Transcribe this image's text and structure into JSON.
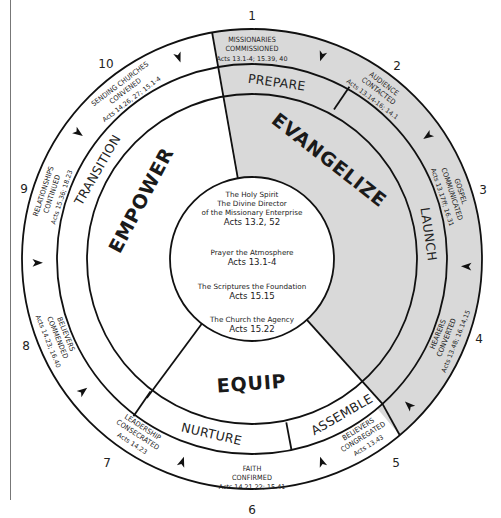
{
  "colors": {
    "shaded": "#d9d9d9",
    "white": "#ffffff",
    "line": "#111111",
    "text": "#222222"
  },
  "center": {
    "lines": [
      "The Holy Spirit",
      "The Divine Director",
      "of the Missionary Enterprise",
      "Acts 13.2, 52",
      "Prayer the Atmosphere",
      "Acts 13.1-4",
      "The Scriptures the Foundation",
      "Acts 15.15",
      "The Church the Agency",
      "Acts 15.22"
    ]
  },
  "phases": {
    "evangelize": "EVANGELIZE",
    "empower": "EMPOWER",
    "equip": "EQUIP"
  },
  "stages": {
    "prepare": "PREPARE",
    "launch": "LAUNCH",
    "assemble": "ASSEMBLE",
    "nurture": "NURTURE",
    "transition": "TRANSITION"
  },
  "steps": [
    {
      "number": "1",
      "line1": "MISSIONARIES",
      "line2": "COMMISSIONED",
      "ref": "Acts 13.1-4; 15.39, 40"
    },
    {
      "number": "2",
      "line1": "AUDIENCE",
      "line2": "CONTACTED",
      "ref": "Acts 13.14-16; 14.1"
    },
    {
      "number": "3",
      "line1": "GOSPEL",
      "line2": "COMMUNICATED",
      "ref": "Acts 13.17ff; 16.31"
    },
    {
      "number": "4",
      "line1": "HEARERS",
      "line2": "CONVERTED",
      "ref": "Acts 13.48; 16.14,15"
    },
    {
      "number": "5",
      "line1": "BELIEVERS",
      "line2": "CONGREGATED",
      "ref": "Acts 13.43"
    },
    {
      "number": "6",
      "line1": "FAITH",
      "line2": "CONFIRMED",
      "ref": "Acts 14.21,22; 15.41"
    },
    {
      "number": "7",
      "line1": "LEADERSHIP",
      "line2": "CONSECRATED",
      "ref": "Acts 14.23"
    },
    {
      "number": "8",
      "line1": "BELIEVERS",
      "line2": "COMMENDED",
      "ref": "Acts 14.23; 16.40"
    },
    {
      "number": "9",
      "line1": "RELATIONSHIPS",
      "line2": "CONTINUED",
      "ref": "Acts 15.36; 18.23"
    },
    {
      "number": "10",
      "line1": "SENDING CHURCHES",
      "line2": "CONVENED",
      "ref": "Acts 14.26, 27; 15.1-4"
    }
  ]
}
